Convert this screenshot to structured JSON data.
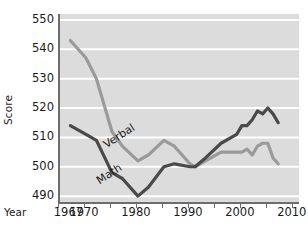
{
  "chart_data": {
    "type": "line",
    "title": "",
    "xlabel": "Year",
    "ylabel": "Score",
    "xlim": [
      1965,
      2011
    ],
    "ylim": [
      488,
      552
    ],
    "grid": true,
    "grid_color": "#ffffff",
    "plot_background": "#dcdcdc",
    "legend": "inline-labels",
    "ytick_labels": [
      "490",
      "500",
      "510",
      "520",
      "530",
      "540",
      "550"
    ],
    "yticks": [
      490,
      500,
      510,
      520,
      530,
      540,
      550
    ],
    "xtick_labels": [
      "1967",
      "1970",
      "1980",
      "1990",
      "2000",
      "2010"
    ],
    "xticks": [
      1967,
      1970,
      1980,
      1990,
      2000,
      2010
    ],
    "xtick_marks": [
      1965,
      1970,
      1975,
      1980,
      1985,
      1990,
      1995,
      2000,
      2005,
      2010
    ],
    "series": [
      {
        "name": "Verbal",
        "color": "#9a9a9a",
        "label_text": "Verbal",
        "x": [
          1967,
          1970,
          1972,
          1975,
          1977,
          1980,
          1982,
          1985,
          1987,
          1990,
          1991,
          1993,
          1996,
          1999,
          2000,
          2001,
          2002,
          2003,
          2004,
          2005,
          2006,
          2007
        ],
        "values": [
          543,
          537,
          530,
          512,
          507,
          502,
          504,
          509,
          507,
          501,
          500,
          502,
          505,
          505,
          505,
          506,
          504,
          507,
          508,
          508,
          503,
          501
        ]
      },
      {
        "name": "Math",
        "color": "#4a4a4a",
        "label_text": "Math",
        "x": [
          1967,
          1970,
          1972,
          1975,
          1977,
          1980,
          1982,
          1985,
          1987,
          1990,
          1991,
          1993,
          1996,
          1999,
          2000,
          2001,
          2002,
          2003,
          2004,
          2005,
          2006,
          2007
        ],
        "values": [
          514,
          511,
          509,
          498,
          496,
          490,
          493,
          500,
          501,
          500,
          500,
          503,
          508,
          511,
          514,
          514,
          516,
          519,
          518,
          520,
          518,
          515
        ]
      }
    ]
  },
  "axes": {
    "y_title": "Score",
    "x_title": "Year"
  }
}
